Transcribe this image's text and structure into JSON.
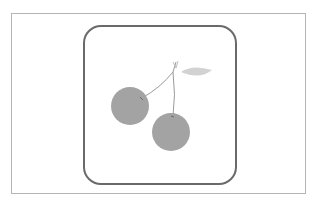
{
  "image": {
    "subject": "cherry-icon",
    "colors": {
      "frame_border": "#b5b5b5",
      "icon_border": "#6a6a6a",
      "cherry_fill": "#a3a3a3",
      "leaf_fill": "#d2d2d2",
      "stem": "#9a9a9a",
      "background": "#ffffff"
    }
  }
}
